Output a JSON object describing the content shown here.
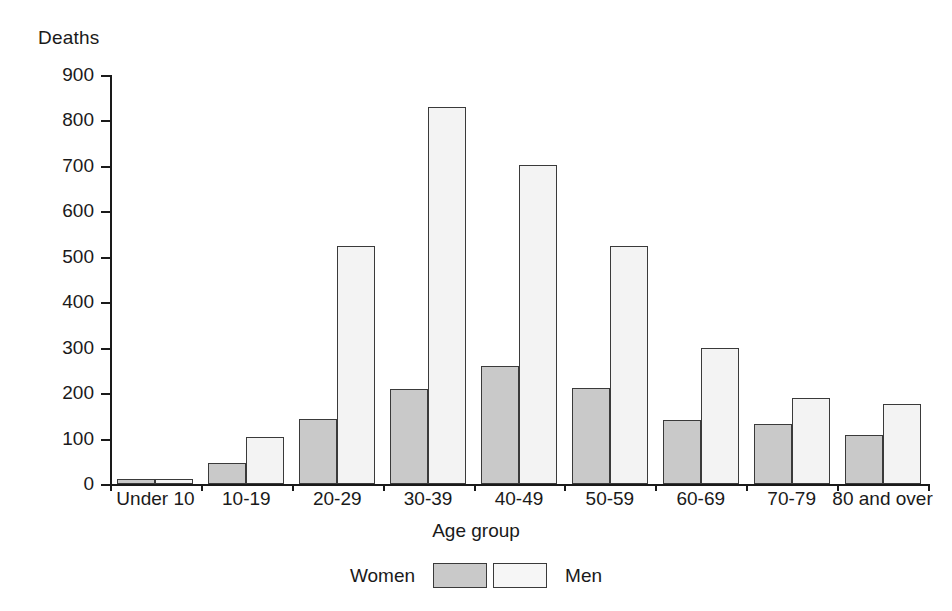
{
  "chart_data": {
    "type": "bar",
    "title": "",
    "xlabel": "Age group",
    "ylabel": "Deaths",
    "categories": [
      "Under 10",
      "10-19",
      "20-29",
      "30-39",
      "40-49",
      "50-59",
      "60-69",
      "70-79",
      "80 and over"
    ],
    "series": [
      {
        "name": "Women",
        "color": "#c9c9c9",
        "values": [
          12,
          47,
          142,
          210,
          260,
          212,
          140,
          131,
          108
        ]
      },
      {
        "name": "Men",
        "color": "#f3f3f3",
        "values": [
          12,
          103,
          524,
          830,
          702,
          524,
          300,
          189,
          176
        ]
      }
    ],
    "ylim": [
      0,
      900
    ],
    "yticks": [
      0,
      100,
      200,
      300,
      400,
      500,
      600,
      700,
      800,
      900
    ],
    "ytick_labels": [
      "0",
      "100",
      "200",
      "300",
      "400",
      "500",
      "600",
      "700",
      "800",
      "900"
    ],
    "grid": false,
    "legend_position": "bottom",
    "legend_entries": [
      "Women",
      "Men"
    ]
  }
}
